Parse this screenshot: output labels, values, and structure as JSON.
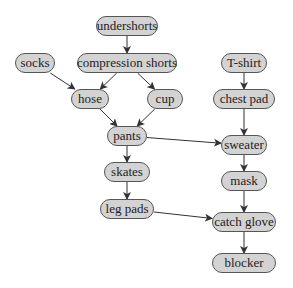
{
  "diagram": {
    "type": "directed-acyclic-graph",
    "nodes": [
      {
        "id": "undershorts",
        "label": "undershorts",
        "cx": 127,
        "cy": 26,
        "w": 62
      },
      {
        "id": "compression_shorts",
        "label": "compression shorts",
        "cx": 127,
        "cy": 63,
        "w": 100
      },
      {
        "id": "socks",
        "label": "socks",
        "cx": 35,
        "cy": 63,
        "w": 40
      },
      {
        "id": "hose",
        "label": "hose",
        "cx": 90,
        "cy": 99,
        "w": 38
      },
      {
        "id": "cup",
        "label": "cup",
        "cx": 165,
        "cy": 99,
        "w": 36
      },
      {
        "id": "pants",
        "label": "pants",
        "cx": 127,
        "cy": 136,
        "w": 40
      },
      {
        "id": "skates",
        "label": "skates",
        "cx": 127,
        "cy": 172,
        "w": 46
      },
      {
        "id": "leg_pads",
        "label": "leg pads",
        "cx": 127,
        "cy": 209,
        "w": 54
      },
      {
        "id": "t_shirt",
        "label": "T-shirt",
        "cx": 244,
        "cy": 63,
        "w": 46
      },
      {
        "id": "chest_pad",
        "label": "chest pad",
        "cx": 244,
        "cy": 99,
        "w": 62
      },
      {
        "id": "sweater",
        "label": "sweater",
        "cx": 244,
        "cy": 145,
        "w": 46
      },
      {
        "id": "mask",
        "label": "mask",
        "cx": 244,
        "cy": 181,
        "w": 46
      },
      {
        "id": "catch_glove",
        "label": "catch glove",
        "cx": 244,
        "cy": 222,
        "w": 64
      },
      {
        "id": "blocker",
        "label": "blocker",
        "cx": 244,
        "cy": 263,
        "w": 64
      }
    ],
    "edges": [
      {
        "from": "undershorts",
        "to": "compression_shorts"
      },
      {
        "from": "compression_shorts",
        "to": "hose"
      },
      {
        "from": "compression_shorts",
        "to": "cup"
      },
      {
        "from": "socks",
        "to": "hose"
      },
      {
        "from": "hose",
        "to": "pants"
      },
      {
        "from": "cup",
        "to": "pants"
      },
      {
        "from": "pants",
        "to": "skates"
      },
      {
        "from": "pants",
        "to": "sweater"
      },
      {
        "from": "skates",
        "to": "leg_pads"
      },
      {
        "from": "leg_pads",
        "to": "catch_glove"
      },
      {
        "from": "t_shirt",
        "to": "chest_pad"
      },
      {
        "from": "chest_pad",
        "to": "sweater"
      },
      {
        "from": "sweater",
        "to": "mask"
      },
      {
        "from": "mask",
        "to": "catch_glove"
      },
      {
        "from": "catch_glove",
        "to": "blocker"
      }
    ],
    "colors": {
      "node_fill": "#d3d3d3",
      "node_border": "#555555",
      "edge": "#333333"
    }
  }
}
